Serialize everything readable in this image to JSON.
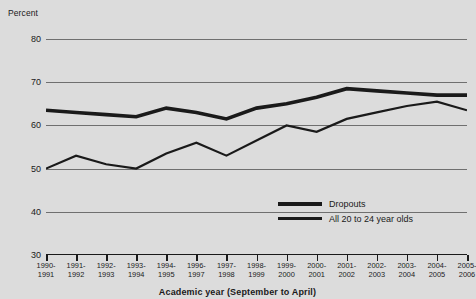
{
  "chart_data": {
    "type": "line",
    "title": "",
    "xlabel": "Academic year (September to April)",
    "ylabel": "Percent",
    "ylim": [
      30,
      80
    ],
    "yticks": [
      30,
      40,
      50,
      60,
      70,
      80
    ],
    "grid": true,
    "legend_position": "bottom-right",
    "categories": [
      "1990-1991",
      "1991-1992",
      "1992-1993",
      "1993-1994",
      "1994-1995",
      "1996-1997",
      "1997-1998",
      "1998-1999",
      "1999-2000",
      "2000-2001",
      "2001-2002",
      "2002-2003",
      "2003-2004",
      "2004-2005",
      "2005-2006"
    ],
    "series": [
      {
        "name": "Dropouts",
        "values": [
          63.5,
          63.0,
          62.5,
          62.0,
          64.0,
          63.0,
          61.5,
          64.0,
          65.0,
          66.5,
          68.5,
          68.0,
          67.5,
          67.0,
          67.0
        ]
      },
      {
        "name": "All 20 to 24 year olds",
        "values": [
          50.0,
          53.0,
          51.0,
          50.0,
          53.5,
          56.0,
          53.0,
          56.5,
          60.0,
          58.5,
          61.5,
          63.0,
          64.5,
          65.5,
          63.5
        ]
      }
    ]
  },
  "axes": {
    "y_title": "Percent",
    "x_title": "Academic year (September to April)",
    "y_tick_labels": [
      "80",
      "70",
      "60",
      "50",
      "40",
      "30"
    ],
    "x_tick_labels": [
      {
        "top": "1990-",
        "bottom": "1991"
      },
      {
        "top": "1991-",
        "bottom": "1992"
      },
      {
        "top": "1992-",
        "bottom": "1993"
      },
      {
        "top": "1993-",
        "bottom": "1994"
      },
      {
        "top": "1994-",
        "bottom": "1995"
      },
      {
        "top": "1996-",
        "bottom": "1997"
      },
      {
        "top": "1997-",
        "bottom": "1998"
      },
      {
        "top": "1998-",
        "bottom": "1999"
      },
      {
        "top": "1999-",
        "bottom": "2000"
      },
      {
        "top": "2000-",
        "bottom": "2001"
      },
      {
        "top": "2001-",
        "bottom": "2002"
      },
      {
        "top": "2002-",
        "bottom": "2003"
      },
      {
        "top": "2003-",
        "bottom": "2004"
      },
      {
        "top": "2004-",
        "bottom": "2005"
      },
      {
        "top": "2005-",
        "bottom": "2006"
      }
    ]
  },
  "legend": {
    "items": [
      {
        "label": "Dropouts",
        "weight": "thick"
      },
      {
        "label": "All 20 to 24 year olds",
        "weight": "thin"
      }
    ]
  },
  "colors": {
    "background": "#dcdcdc",
    "ink": "#1a1a1a",
    "gridline": "#6f6f6f"
  }
}
